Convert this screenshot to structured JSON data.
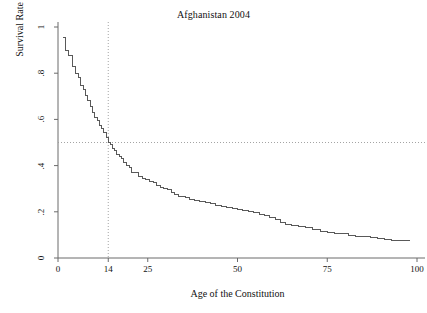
{
  "chart_data": {
    "type": "line",
    "subtype": "kaplan-meier-step",
    "title": "Afghanistan 2004",
    "xlabel": "Age of the Constitution",
    "ylabel": "Survival Rate",
    "xlim": [
      0,
      100
    ],
    "ylim": [
      0,
      1
    ],
    "grid": false,
    "legend": null,
    "xticks": [
      0,
      14,
      25,
      50,
      75,
      100
    ],
    "xtick_labels": [
      "0",
      "14",
      "25",
      "50",
      "75",
      "100"
    ],
    "yticks": [
      0,
      0.2,
      0.4,
      0.6,
      0.8,
      1
    ],
    "ytick_labels": [
      "0",
      ".2",
      ".4",
      ".6",
      ".8",
      "1"
    ],
    "annotations": [
      {
        "name": "median-vline",
        "type": "vertical-reference-line",
        "x": 14,
        "style": "dotted"
      },
      {
        "name": "median-hline",
        "type": "horizontal-reference-line",
        "y": 0.5,
        "style": "dotted"
      }
    ],
    "series": [
      {
        "name": "Survival Rate",
        "color": "#595959",
        "style": "step-post",
        "x": [
          1.5,
          2,
          3,
          4,
          5,
          5.6,
          6.2,
          7,
          7.6,
          8.2,
          9,
          9.6,
          10.3,
          11,
          11.6,
          12.2,
          12.8,
          13.4,
          14,
          14.6,
          15.2,
          15.8,
          16.4,
          17,
          17.6,
          18.2,
          19,
          19.8,
          20.6,
          21.6,
          22.5,
          23.5,
          24.5,
          25.5,
          26.5,
          27.5,
          28.5,
          29.5,
          30.5,
          31.5,
          32.5,
          33.5,
          34.5,
          35.5,
          36.5,
          38,
          39.5,
          41,
          42.5,
          44,
          45.5,
          47,
          48.5,
          50,
          51.5,
          53,
          54.5,
          56,
          57.5,
          59,
          60.5,
          62,
          63.5,
          65,
          67,
          69,
          71,
          73,
          75,
          77,
          79,
          81,
          83,
          85,
          87,
          89,
          91,
          93,
          98
        ],
        "y": [
          0.955,
          0.955,
          0.9,
          0.875,
          0.83,
          0.8,
          0.78,
          0.745,
          0.73,
          0.705,
          0.68,
          0.655,
          0.63,
          0.61,
          0.595,
          0.575,
          0.56,
          0.545,
          0.52,
          0.5,
          0.49,
          0.475,
          0.465,
          0.45,
          0.44,
          0.43,
          0.415,
          0.4,
          0.39,
          0.37,
          0.37,
          0.355,
          0.345,
          0.34,
          0.33,
          0.325,
          0.315,
          0.305,
          0.3,
          0.295,
          0.285,
          0.275,
          0.268,
          0.268,
          0.26,
          0.255,
          0.25,
          0.245,
          0.24,
          0.235,
          0.228,
          0.222,
          0.218,
          0.215,
          0.21,
          0.205,
          0.2,
          0.195,
          0.19,
          0.185,
          0.175,
          0.165,
          0.155,
          0.145,
          0.142,
          0.138,
          0.13,
          0.122,
          0.115,
          0.11,
          0.108,
          0.105,
          0.098,
          0.095,
          0.092,
          0.088,
          0.085,
          0.078,
          0.075
        ]
      }
    ]
  }
}
